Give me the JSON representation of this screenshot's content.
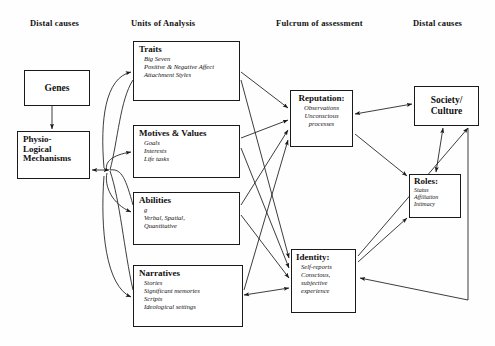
{
  "diagram": {
    "type": "flow-diagram",
    "background": "#fefefe",
    "line_color": "#1a1a1a"
  },
  "headers": [
    {
      "label": "Distal causes",
      "x": 30,
      "y": 18
    },
    {
      "label": "Units of Analysis",
      "x": 131,
      "y": 18
    },
    {
      "label": "Fulcrum of assessment",
      "x": 276,
      "y": 18
    },
    {
      "label": "Distal causes",
      "x": 413,
      "y": 18
    }
  ],
  "boxes": {
    "genes": {
      "title": "Genes",
      "x": 24,
      "y": 70,
      "w": 66,
      "h": 36,
      "align": "center"
    },
    "physio": {
      "title": "Physio-\nLogical\nMechanisms",
      "x": 17,
      "y": 131,
      "w": 73,
      "h": 48,
      "align": "left"
    },
    "traits": {
      "title": "Traits",
      "items": [
        "Big Seven",
        "Positive & Negative Affect",
        "Attachment Styles"
      ],
      "x": 133,
      "y": 41,
      "w": 107,
      "h": 60
    },
    "motives": {
      "title": "Motives & Values",
      "items": [
        "Goals",
        "Interests",
        "Life tasks"
      ],
      "x": 133,
      "y": 125,
      "w": 107,
      "h": 53
    },
    "abilities": {
      "title": "Abilities",
      "items": [
        "g",
        "Verbal, Spatial,",
        "Quantitative"
      ],
      "x": 133,
      "y": 192,
      "w": 107,
      "h": 53
    },
    "narratives": {
      "title": "Narratives",
      "items": [
        "Stories",
        "Significant memories",
        "Scripts",
        "Ideological settings"
      ],
      "x": 133,
      "y": 265,
      "w": 110,
      "h": 62
    },
    "reputation": {
      "title": "Reputation:",
      "items": [
        "Observations",
        "Unconscious",
        "processes"
      ],
      "x": 290,
      "y": 90,
      "w": 63,
      "h": 57
    },
    "identity": {
      "title": "Identity:",
      "items": [
        "Self-reports",
        "Conscious,",
        "subjective",
        "experience"
      ],
      "x": 291,
      "y": 249,
      "w": 65,
      "h": 64
    },
    "roles": {
      "title": "Roles:",
      "items": [
        "Status",
        "Affiliation",
        "Intimacy"
      ],
      "x": 409,
      "y": 174,
      "w": 52,
      "h": 44
    },
    "society": {
      "title": "Society/\nCulture",
      "x": 414,
      "y": 86,
      "w": 65,
      "h": 40,
      "align": "center"
    }
  },
  "connections": [
    {
      "from": "genes",
      "to": "physio",
      "arrow": "single"
    },
    {
      "from": "physio",
      "to": "units-hub",
      "arrow": "double"
    },
    {
      "from": "units-hub",
      "to": "traits",
      "arrow": "single",
      "style": "curved"
    },
    {
      "from": "units-hub",
      "to": "motives",
      "arrow": "single",
      "style": "curved"
    },
    {
      "from": "units-hub",
      "to": "abilities",
      "arrow": "single",
      "style": "curved"
    },
    {
      "from": "units-hub",
      "to": "narratives",
      "arrow": "single",
      "style": "curved"
    },
    {
      "from": "traits",
      "to": "reputation",
      "arrow": "single"
    },
    {
      "from": "traits",
      "to": "identity",
      "arrow": "single"
    },
    {
      "from": "motives",
      "to": "reputation",
      "arrow": "single"
    },
    {
      "from": "motives",
      "to": "identity",
      "arrow": "single"
    },
    {
      "from": "abilities",
      "to": "reputation",
      "arrow": "single"
    },
    {
      "from": "abilities",
      "to": "identity",
      "arrow": "single"
    },
    {
      "from": "narratives",
      "to": "reputation",
      "arrow": "single"
    },
    {
      "from": "narratives",
      "to": "identity",
      "arrow": "double"
    },
    {
      "from": "reputation",
      "to": "society",
      "arrow": "double"
    },
    {
      "from": "reputation",
      "to": "roles",
      "arrow": "single"
    },
    {
      "from": "roles",
      "to": "society",
      "arrow": "double"
    },
    {
      "from": "identity",
      "to": "roles",
      "arrow": "single"
    },
    {
      "from": "society",
      "to": "identity",
      "arrow": "single",
      "style": "elbow"
    }
  ]
}
